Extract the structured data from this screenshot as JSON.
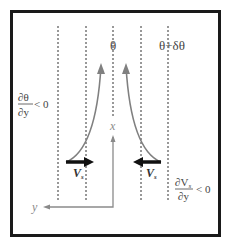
{
  "diagram": {
    "labels": {
      "theta": "θ",
      "theta_plus": "θ+δθ",
      "dtheta_num": "∂θ",
      "dtheta_den": "∂y",
      "dtheta_rel": "< 0",
      "dvs_num": "∂V",
      "dvs_num_sub": "s",
      "dvs_den": "∂y",
      "dvs_rel": "< 0",
      "vs_left": "V",
      "vs_left_sub": "s",
      "vs_right": "V",
      "vs_right_sub": "s",
      "x_axis": "x",
      "y_axis": "y"
    },
    "colors": {
      "frame": "#1a1a1a",
      "dashed": "#333333",
      "flow_curve": "#808080",
      "axis": "#8a8a8a",
      "vs_arrow": "#111111",
      "text": "#444444"
    }
  }
}
